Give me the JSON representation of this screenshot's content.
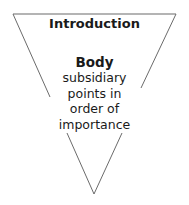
{
  "diagram": {
    "type": "inverted-pyramid",
    "line_color": "#6b6b6b",
    "top_section": {
      "label": "Introduction"
    },
    "body_section": {
      "title": "Body",
      "lines": [
        "subsidiary",
        "points in",
        "order of",
        "importance"
      ]
    }
  }
}
